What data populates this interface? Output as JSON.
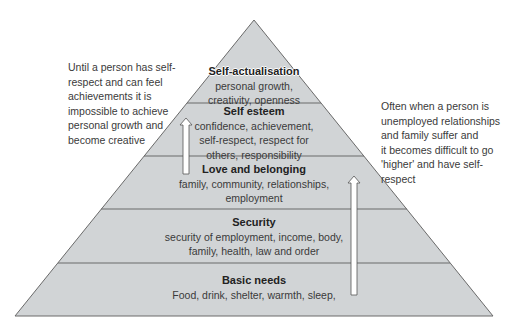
{
  "diagram": {
    "type": "pyramid",
    "fill_color": "#d1d4d6",
    "line_color": "#6a6a6a",
    "tiers": [
      {
        "title": "Self-actualisation",
        "body": "personal growth,\ncreativity, openness"
      },
      {
        "title": "Self esteem",
        "body": "confidence, achievement,\nself-respect, respect for\nothers, responsibility"
      },
      {
        "title": "Love and belonging",
        "body": "family, community, relationships,\nemployment"
      },
      {
        "title": "Security",
        "body": "security of employment, income, body,\nfamily, health, law and order"
      },
      {
        "title": "Basic needs",
        "body": "Food, drink, shelter, warmth, sleep,"
      }
    ],
    "arrows": [
      {
        "name": "upward-arrow-left",
        "from_tier": "Love and belonging",
        "to_tier": "Self esteem"
      },
      {
        "name": "upward-arrow-right",
        "from_tier": "Basic needs",
        "to_tier": "Love and belonging"
      }
    ]
  },
  "notes": {
    "left": "Until a person has self-\nrespect and can feel\nachievements it is\nimpossible to achieve\npersonal growth and\nbecome creative",
    "right": "Often when a person is\nunemployed relationships\nand family suffer and\nit becomes difficult to go\n'higher' and have self-\nrespect"
  }
}
